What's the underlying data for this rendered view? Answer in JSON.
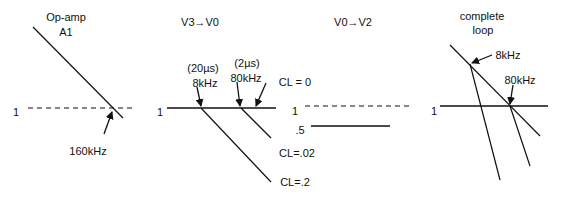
{
  "panels": [
    {
      "id": "opamp",
      "title_line1": "Op-amp",
      "title_line2": "A1",
      "unity_label": "1",
      "crossover_label": "160kHz"
    },
    {
      "id": "v3-v0",
      "title": "V3→V0",
      "unity_label": "1",
      "pole1_time": "(20µs)",
      "pole1_freq": "8kHz",
      "pole2_time": "(2µs)",
      "pole2_freq": "80kHz",
      "curve_labels": [
        "CL = 0",
        "CL=.02",
        "CL=.2"
      ]
    },
    {
      "id": "v0-v2",
      "title": "V0→V2",
      "unity_label": "1",
      "gain_label": ".5"
    },
    {
      "id": "complete-loop",
      "title_line1": "complete",
      "title_line2": "loop",
      "unity_label": "1",
      "break1_label": "8kHz",
      "break2_label": "80kHz"
    }
  ],
  "colors": {
    "line": "#111111",
    "background": "#ffffff"
  }
}
